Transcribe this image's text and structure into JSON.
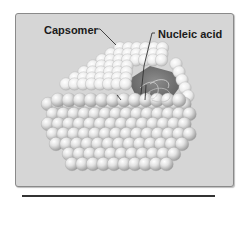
{
  "diagram": {
    "labels": [
      {
        "id": "capsomer",
        "text": "Capsomer"
      },
      {
        "id": "nucleic_acid",
        "text": "Nucleic acid"
      }
    ]
  },
  "colors": {
    "panel_background": "#d6d6d6",
    "panel_border": "#8a8a8a",
    "sphere_light": "#f4f4f4",
    "sphere_dark": "#9a9a9a",
    "interior": "#6e6e6e",
    "rule": "#333333"
  }
}
